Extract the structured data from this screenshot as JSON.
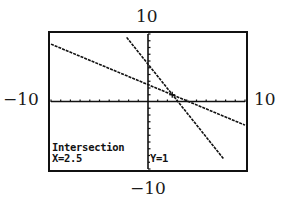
{
  "window_labels": {
    "ymax": "10",
    "xmin": "−10",
    "xmax": "10",
    "ymin": "−10"
  },
  "calculator_screen": {
    "title": "Intersection",
    "x_readout": "X=2.5",
    "y_readout": "Y=1"
  },
  "chart_data": {
    "type": "line",
    "title": "Intersection",
    "xlabel": "",
    "ylabel": "",
    "xlim": [
      -10,
      10
    ],
    "ylim": [
      -10,
      10
    ],
    "x_tick_step": 1,
    "y_tick_step": 1,
    "grid": false,
    "series": [
      {
        "name": "line-1 (shallow)",
        "x": [
          -10,
          10
        ],
        "y": [
          8.5,
          -3.5
        ],
        "approx_equation": "y = -0.6x + 2.5"
      },
      {
        "name": "line-2 (steep)",
        "x": [
          -2.2,
          7.8
        ],
        "y": [
          9.5,
          -8.5
        ],
        "approx_equation": "y = -1.8x + 5.5"
      }
    ],
    "annotations": [
      {
        "type": "intersection",
        "x": 2.5,
        "y": 1,
        "label": "Intersection X=2.5 Y=1"
      }
    ],
    "axis_labels_outside": {
      "top": "10",
      "left": "-10",
      "right": "10",
      "bottom": "-10"
    },
    "colors": {
      "foreground": "#111111",
      "background": "#ffffff"
    }
  }
}
